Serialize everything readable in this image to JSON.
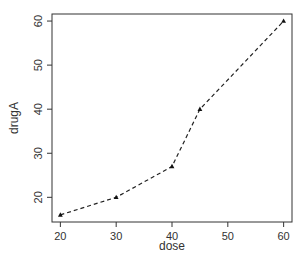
{
  "chart_data": {
    "type": "line",
    "title": "",
    "xlabel": "dose",
    "ylabel": "drugA",
    "x": [
      20,
      30,
      40,
      45,
      60
    ],
    "series": [
      {
        "name": "drugA",
        "values": [
          16,
          20,
          27,
          40,
          60
        ],
        "line_style": "dashed",
        "marker": "triangle"
      }
    ],
    "xlim": [
      18.5,
      61.5
    ],
    "ylim": [
      14.4,
      61.6
    ],
    "xticks": [
      20,
      30,
      40,
      50,
      60
    ],
    "yticks": [
      20,
      30,
      40,
      50,
      60
    ],
    "grid": false,
    "legend": null
  },
  "labels": {
    "xlabel": "dose",
    "ylabel": "drugA",
    "xticks": [
      "20",
      "30",
      "40",
      "50",
      "60"
    ],
    "yticks": [
      "20",
      "30",
      "40",
      "50",
      "60"
    ]
  },
  "colors": {
    "line": "#222222",
    "axis": "#333333"
  }
}
